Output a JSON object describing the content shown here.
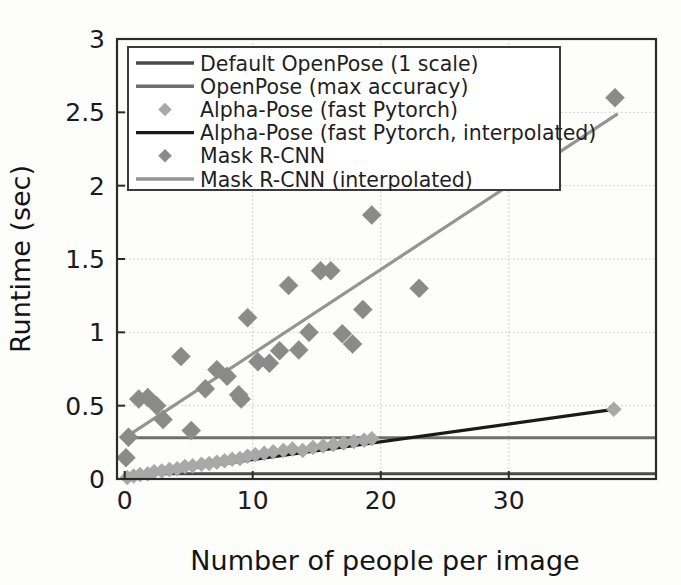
{
  "chart_data": {
    "type": "scatter",
    "title": "",
    "xlabel": "Number of people per image",
    "ylabel": "Runtime (sec)",
    "xlim": [
      -0.6,
      41.5
    ],
    "ylim": [
      0,
      3
    ],
    "xticks": [
      0,
      10,
      20,
      30
    ],
    "xtick_labels": [
      "0",
      "10",
      "20",
      "30"
    ],
    "yticks": [
      0,
      0.5,
      1,
      1.5,
      2,
      2.5,
      3
    ],
    "ytick_labels": [
      "0",
      "0.5",
      "1",
      "1.5",
      "2",
      "2.5",
      "3"
    ],
    "grid": true,
    "legend_position": "upper-left",
    "series": [
      {
        "name": "Default OpenPose (1 scale)",
        "kind": "hline",
        "marker": "line",
        "color": "#4a4a4a",
        "value": 0.035,
        "x": [
          0,
          41.5
        ],
        "values": [
          0.035,
          0.035
        ]
      },
      {
        "name": "OpenPose (max accuracy)",
        "kind": "hline",
        "marker": "line",
        "color": "#6f6f6f",
        "value": 0.282,
        "x": [
          0,
          41.5
        ],
        "values": [
          0.282,
          0.282
        ]
      },
      {
        "name": "Alpha-Pose (fast Pytorch)",
        "kind": "scatter",
        "marker": "diamond",
        "color": "#a8a8a8",
        "points": [
          [
            0.2,
            0.01
          ],
          [
            0.7,
            0.02
          ],
          [
            1.2,
            0.03
          ],
          [
            1.8,
            0.035
          ],
          [
            2.3,
            0.05
          ],
          [
            2.9,
            0.055
          ],
          [
            3.5,
            0.065
          ],
          [
            4.1,
            0.07
          ],
          [
            4.7,
            0.085
          ],
          [
            5.3,
            0.09
          ],
          [
            6.0,
            0.1
          ],
          [
            6.6,
            0.105
          ],
          [
            7.2,
            0.115
          ],
          [
            7.8,
            0.125
          ],
          [
            8.4,
            0.135
          ],
          [
            9.0,
            0.14
          ],
          [
            9.6,
            0.155
          ],
          [
            10.2,
            0.165
          ],
          [
            10.9,
            0.175
          ],
          [
            11.6,
            0.185
          ],
          [
            12.4,
            0.195
          ],
          [
            13.1,
            0.205
          ],
          [
            13.9,
            0.195
          ],
          [
            14.7,
            0.215
          ],
          [
            15.5,
            0.225
          ],
          [
            16.3,
            0.235
          ],
          [
            17.1,
            0.245
          ],
          [
            17.9,
            0.255
          ],
          [
            18.7,
            0.265
          ],
          [
            19.3,
            0.275
          ],
          [
            38.2,
            0.475
          ]
        ]
      },
      {
        "name": "Alpha-Pose (fast Pytorch, interpolated)",
        "kind": "line",
        "marker": "line",
        "color": "#1a1a1a",
        "x": [
          0,
          38.5
        ],
        "values": [
          0.012,
          0.478
        ]
      },
      {
        "name": "Mask R-CNN",
        "kind": "scatter",
        "marker": "diamond",
        "color": "#8a8a8a",
        "points": [
          [
            0.1,
            0.145
          ],
          [
            0.3,
            0.285
          ],
          [
            1.1,
            0.545
          ],
          [
            1.8,
            0.555
          ],
          [
            2.5,
            0.5
          ],
          [
            3.0,
            0.405
          ],
          [
            4.4,
            0.835
          ],
          [
            5.2,
            0.33
          ],
          [
            6.3,
            0.615
          ],
          [
            7.2,
            0.745
          ],
          [
            8.0,
            0.7
          ],
          [
            8.9,
            0.575
          ],
          [
            9.1,
            0.545
          ],
          [
            9.6,
            1.1
          ],
          [
            10.4,
            0.8
          ],
          [
            11.3,
            0.79
          ],
          [
            12.1,
            0.875
          ],
          [
            12.8,
            1.32
          ],
          [
            13.6,
            0.88
          ],
          [
            14.4,
            1.0
          ],
          [
            15.3,
            1.42
          ],
          [
            16.1,
            1.42
          ],
          [
            17.0,
            0.99
          ],
          [
            17.8,
            0.92
          ],
          [
            18.6,
            1.155
          ],
          [
            19.3,
            1.8
          ],
          [
            23.0,
            1.3
          ],
          [
            38.3,
            2.6
          ]
        ]
      },
      {
        "name": "Mask R-CNN (interpolated)",
        "kind": "line",
        "marker": "line",
        "color": "#949494",
        "x": [
          0,
          38.5
        ],
        "values": [
          0.28,
          2.49
        ]
      }
    ]
  },
  "legend": {
    "entries": [
      {
        "label": "Default OpenPose (1 scale)",
        "marker": "line",
        "color": "#4a4a4a"
      },
      {
        "label": "OpenPose (max accuracy)",
        "marker": "line",
        "color": "#6f6f6f"
      },
      {
        "label": "Alpha-Pose (fast Pytorch)",
        "marker": "diamond",
        "color": "#a8a8a8"
      },
      {
        "label": "Alpha-Pose (fast Pytorch, interpolated)",
        "marker": "line",
        "color": "#1a1a1a"
      },
      {
        "label": "Mask R-CNN",
        "marker": "diamond",
        "color": "#8a8a8a"
      },
      {
        "label": "Mask R-CNN (interpolated)",
        "marker": "line",
        "color": "#949494"
      }
    ]
  },
  "colors": {
    "axis": "#2b2b2b",
    "grid": "#c9c9c9",
    "background": "#fdfdfc",
    "text": "#1b1b1b"
  }
}
